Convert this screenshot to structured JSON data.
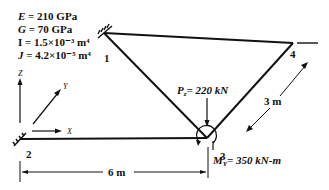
{
  "properties": [
    {
      "symbol": "E",
      "text": " = 210 GPa"
    },
    {
      "symbol": "G",
      "text": " = 70 GPa"
    },
    {
      "symbol": "I",
      "text": " = 1.5×10⁻³ m⁴"
    },
    {
      "symbol": "J",
      "text": " = 4.2×10⁻⁵ m⁴"
    }
  ],
  "axes": {
    "x": "X",
    "y": "Y",
    "z": "Z"
  },
  "nodes": {
    "n1": "1",
    "n2": "2",
    "n3": "3",
    "n4": "4"
  },
  "loads": {
    "force": "Pz = 220 kN",
    "moment": "MY = 350 kN-m"
  },
  "dimensions": {
    "horizontal": "6 m",
    "diagonal": "3 m"
  }
}
